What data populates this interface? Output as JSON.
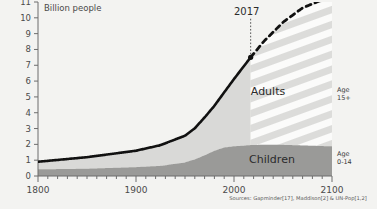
{
  "chart_data": {
    "type": "area",
    "title": "",
    "ylabel": "Billion people",
    "xlabel": "",
    "ylim": [
      0,
      11
    ],
    "xlim": [
      1800,
      2100
    ],
    "grid": false,
    "legend_position": "right-inline",
    "y_ticks": [
      "0",
      "1",
      "2",
      "3",
      "4",
      "5",
      "6",
      "7",
      "8",
      "9",
      "10",
      "11"
    ],
    "x_ticks": [
      "1800",
      "1900",
      "2000",
      "2100"
    ],
    "x_minor_tick_step": 10,
    "annotations": [
      {
        "label": "2017",
        "x": 2017,
        "y": 7.5,
        "style": "dotted-vline"
      }
    ],
    "series": [
      {
        "name": "Children",
        "legend_label": "Children",
        "age_label_line1": "Age",
        "age_label_line2": "0-14",
        "color": "#9a9a98",
        "x": [
          1800,
          1850,
          1900,
          1925,
          1950,
          1960,
          1970,
          1980,
          1990,
          2000,
          2010,
          2017,
          2030,
          2050,
          2070,
          2090,
          2100
        ],
        "values": [
          0.42,
          0.46,
          0.56,
          0.64,
          0.86,
          1.05,
          1.31,
          1.59,
          1.8,
          1.88,
          1.92,
          1.95,
          1.98,
          1.97,
          1.93,
          1.89,
          1.87
        ]
      },
      {
        "name": "Adults",
        "legend_label": "Adults",
        "age_label_line1": "Age",
        "age_label_line2": "15+",
        "color": "#d9d9d7",
        "forecast_fill": "striped",
        "x": [
          1800,
          1850,
          1900,
          1925,
          1950,
          1960,
          1970,
          1980,
          1990,
          2000,
          2010,
          2017,
          2030,
          2050,
          2070,
          2090,
          2100
        ],
        "values": [
          0.48,
          0.73,
          1.04,
          1.31,
          1.69,
          1.97,
          2.39,
          2.85,
          3.49,
          4.25,
          5.02,
          5.55,
          6.5,
          7.75,
          8.7,
          9.25,
          9.4
        ]
      }
    ],
    "total_line": {
      "name": "Total population",
      "color": "#111111",
      "x": [
        1800,
        1850,
        1900,
        1925,
        1950,
        1960,
        1970,
        1980,
        1990,
        2000,
        2010,
        2017
      ],
      "values": [
        0.9,
        1.19,
        1.6,
        1.95,
        2.55,
        3.02,
        3.7,
        4.44,
        5.29,
        6.13,
        6.94,
        7.5
      ],
      "forecast_x": [
        2017,
        2030,
        2050,
        2070,
        2090,
        2100
      ],
      "forecast_values": [
        7.5,
        8.48,
        9.72,
        10.63,
        11.14,
        11.27
      ],
      "forecast_style": "dashed"
    },
    "source": "Sources: Gapminder[17], Maddison[2] & UN-Pop[1,2]"
  },
  "colors": {
    "background": "#f3f3f1",
    "axis": "#6d6d6d",
    "children": "#9a9a98",
    "adults": "#d9d9d7",
    "stripe": "#fbfbfa",
    "line": "#111111",
    "text": "#3a3a3a"
  }
}
